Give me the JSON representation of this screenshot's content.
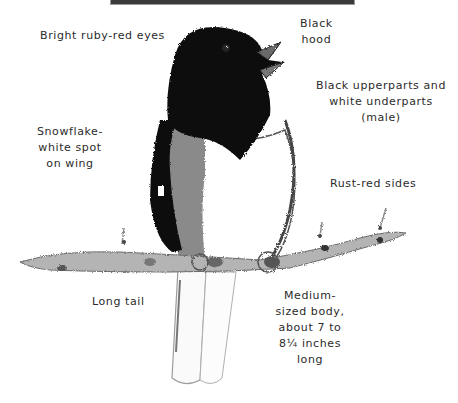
{
  "figure": {
    "labels": {
      "eyes": [
        "Bright ruby-red eyes"
      ],
      "hood": [
        "Black",
        "hood"
      ],
      "upperparts": [
        "Black upperparts and",
        "white underparts",
        "(male)"
      ],
      "wing_spot": [
        "Snowflake-",
        "white spot",
        "on wing"
      ],
      "sides": [
        "Rust-red sides"
      ],
      "tail": [
        "Long tail"
      ],
      "body": [
        "Medium-",
        "sized body,",
        "about 7 to",
        "8¼ inches",
        "long"
      ]
    }
  }
}
